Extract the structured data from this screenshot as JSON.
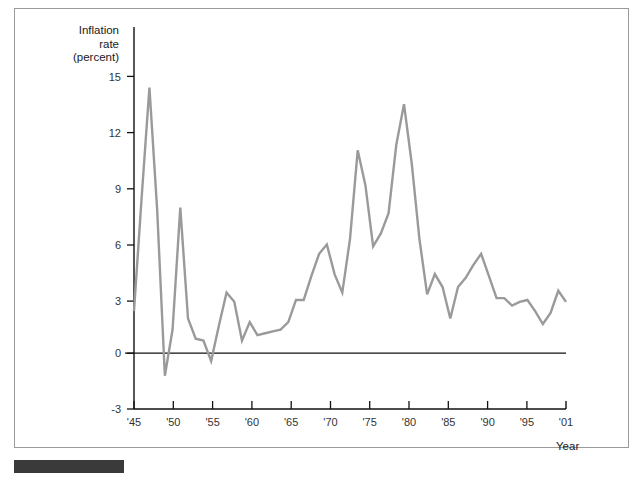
{
  "figure": {
    "frame_border_color": "#9a9a9a",
    "background_color": "#ffffff",
    "caption_bar_color": "#3a3a3a"
  },
  "axes": {
    "y_axis_title_line1": "Inflation",
    "y_axis_title_line2": "rate",
    "y_axis_title_line3": "(percent)",
    "x_axis_title": "Year"
  },
  "chart_data": {
    "type": "line",
    "title": "",
    "subtitle": "",
    "xlabel": "Year",
    "ylabel": "Inflation rate (percent)",
    "line_color": "#9a9a9a",
    "zero_line_color": "#111111",
    "axis_color": "#111111",
    "grid": false,
    "legend": null,
    "legend_position": "none",
    "xlim": [
      1945,
      2001
    ],
    "ylim": [
      -3,
      16.2
    ],
    "y_ticks": [
      15,
      12,
      9,
      6,
      3,
      0,
      -3
    ],
    "y_tick_labels": [
      "15",
      "12",
      "9",
      "6",
      "3",
      "0",
      "-3"
    ],
    "x_ticks": [
      1945,
      1950,
      1955,
      1960,
      1965,
      1970,
      1975,
      1980,
      1985,
      1990,
      1995,
      2001
    ],
    "x_tick_labels": [
      "'45",
      "'50",
      "'55",
      "'60",
      "'65",
      "'70",
      "'75",
      "'80",
      "'85",
      "'90",
      "'95",
      "'01"
    ],
    "x_minor_ticks": [
      1945,
      1950,
      1955,
      1960,
      1965,
      1970,
      1975,
      1980,
      1985,
      1990,
      1995,
      2000
    ],
    "x": [
      1945,
      1946,
      1947,
      1948,
      1949,
      1950,
      1951,
      1952,
      1953,
      1954,
      1955,
      1956,
      1957,
      1958,
      1959,
      1960,
      1961,
      1962,
      1963,
      1964,
      1965,
      1966,
      1967,
      1968,
      1969,
      1970,
      1971,
      1972,
      1973,
      1974,
      1975,
      1976,
      1977,
      1978,
      1979,
      1980,
      1981,
      1982,
      1983,
      1984,
      1985,
      1986,
      1987,
      1988,
      1989,
      1990,
      1991,
      1992,
      1993,
      1994,
      1995,
      1996,
      1997,
      1998,
      1999,
      2000,
      2001
    ],
    "y": [
      2.3,
      8.5,
      14.4,
      7.8,
      -1.2,
      1.3,
      7.9,
      1.9,
      0.8,
      0.7,
      -0.4,
      1.5,
      3.3,
      2.8,
      0.7,
      1.7,
      1.0,
      1.1,
      1.2,
      1.3,
      1.7,
      2.9,
      2.9,
      4.2,
      5.4,
      5.9,
      4.3,
      3.3,
      6.2,
      11.0,
      9.1,
      5.8,
      6.5,
      7.6,
      11.3,
      13.5,
      10.3,
      6.2,
      3.2,
      4.3,
      3.6,
      1.9,
      3.6,
      4.1,
      4.8,
      5.4,
      4.2,
      3.0,
      3.0,
      2.6,
      2.8,
      2.9,
      2.3,
      1.6,
      2.2,
      3.4,
      2.8
    ],
    "series": [
      {
        "name": "Inflation rate (percent)",
        "values": [
          2.3,
          8.5,
          14.4,
          7.8,
          -1.2,
          1.3,
          7.9,
          1.9,
          0.8,
          0.7,
          -0.4,
          1.5,
          3.3,
          2.8,
          0.7,
          1.7,
          1.0,
          1.1,
          1.2,
          1.3,
          1.7,
          2.9,
          2.9,
          4.2,
          5.4,
          5.9,
          4.3,
          3.3,
          6.2,
          11.0,
          9.1,
          5.8,
          6.5,
          7.6,
          11.3,
          13.5,
          10.3,
          6.2,
          3.2,
          4.3,
          3.6,
          1.9,
          3.6,
          4.1,
          4.8,
          5.4,
          4.2,
          3.0,
          3.0,
          2.6,
          2.8,
          2.9,
          2.3,
          1.6,
          2.2,
          3.4,
          2.8
        ]
      }
    ],
    "annotations": []
  }
}
